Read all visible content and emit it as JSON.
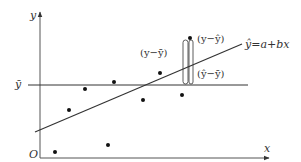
{
  "diagram": {
    "type": "regression-decomposition",
    "axes": {
      "x_label": "x",
      "y_label": "y",
      "origin_label": "O"
    },
    "mean_line": {
      "label": "ȳ"
    },
    "regression_line": {
      "label": "ŷ=a+bx"
    },
    "brackets": {
      "total": "(y−ȳ)",
      "residual": "(y−ŷ)",
      "explained": "(ŷ−ȳ)"
    },
    "points": [
      [
        55,
        152
      ],
      [
        69,
        110
      ],
      [
        85,
        89
      ],
      [
        108,
        145
      ],
      [
        114,
        82
      ],
      [
        143,
        100
      ],
      [
        160,
        73
      ],
      [
        182,
        95
      ],
      [
        190,
        38
      ]
    ],
    "colors": {
      "stroke": "#333333",
      "point": "#111111"
    }
  }
}
